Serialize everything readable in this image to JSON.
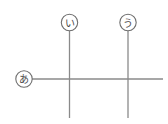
{
  "figure": {
    "title": "",
    "background_color": "#ffffff",
    "line_color": "#8a8a8a",
    "circle_stroke_color": "#6e6e6e",
    "circle_fill_color": "#ffffff",
    "label_text_color": "#4a4a4a",
    "width": 168,
    "height": 124
  },
  "labels": [
    {
      "id": "a",
      "text": "あ",
      "name": "callout-label-a",
      "cx": 24,
      "cy": 79,
      "r": 8.2,
      "points_to": "horizontal-line"
    },
    {
      "id": "i",
      "text": "い",
      "name": "callout-label-i",
      "cx": 69.5,
      "cy": 22.5,
      "r": 8.2,
      "points_to": "vertical-line-left"
    },
    {
      "id": "u",
      "text": "う",
      "name": "callout-label-u",
      "cx": 128,
      "cy": 22.5,
      "r": 8.2,
      "points_to": "vertical-line-right"
    }
  ],
  "lines": [
    {
      "id": "horizontal-line",
      "name": "horizontal-line",
      "orientation": "horizontal",
      "x1": 32,
      "y1": 79,
      "x2": 163,
      "y2": 79
    },
    {
      "id": "vertical-line-left",
      "name": "vertical-line-left",
      "orientation": "vertical",
      "x1": 69.5,
      "y1": 31,
      "x2": 69.5,
      "y2": 118
    },
    {
      "id": "vertical-line-right",
      "name": "vertical-line-right",
      "orientation": "vertical",
      "x1": 128,
      "y1": 31,
      "x2": 128,
      "y2": 118
    }
  ],
  "intersections": [
    {
      "name": "intersection-left",
      "x": 69.5,
      "y": 79
    },
    {
      "name": "intersection-right",
      "x": 128,
      "y": 79
    }
  ]
}
